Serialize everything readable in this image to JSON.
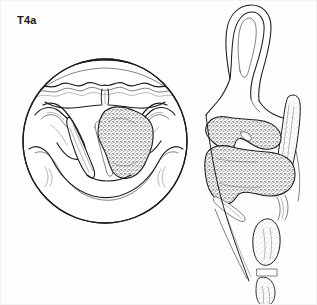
{
  "figure": {
    "stage_label": "T4a",
    "view_left_name": "laryngoscopic-view",
    "view_right_name": "sagittal-section-view",
    "background_color": "#fefefe",
    "ink_color": "#1d1d1d",
    "tumor_fill_color": "#6e6e6e"
  },
  "laryngoscopic_view": {
    "outline_shape": "circle",
    "structures": [
      {
        "key": "epiglottis",
        "label": "epiglottis"
      },
      {
        "key": "median-glossoepiglottic-fold",
        "label": "median glossoepiglottic fold"
      },
      {
        "key": "vallecula",
        "label": "vallecula"
      },
      {
        "key": "aryepiglottic-fold-left",
        "label": "left aryepiglottic fold"
      },
      {
        "key": "aryepiglottic-fold-right",
        "label": "right aryepiglottic fold"
      },
      {
        "key": "true-vocal-cord-left",
        "label": "left true vocal cord"
      },
      {
        "key": "true-vocal-cord-right",
        "label": "right true vocal cord"
      },
      {
        "key": "arytenoid-left",
        "label": "left arytenoid"
      },
      {
        "key": "arytenoid-right",
        "label": "right arytenoid"
      },
      {
        "key": "posterior-commissure",
        "label": "posterior commissure"
      },
      {
        "key": "pyriform-sinus",
        "label": "pyriform sinus"
      },
      {
        "key": "tumor-mass",
        "label": "tumour mass"
      }
    ]
  },
  "sagittal_view": {
    "structures": [
      {
        "key": "epiglottis-cartilage",
        "label": "epiglottic cartilage"
      },
      {
        "key": "pre-epiglottic-space",
        "label": "pre-epiglottic space"
      },
      {
        "key": "thyroid-cartilage",
        "label": "thyroid cartilage"
      },
      {
        "key": "cricoid-cartilage",
        "label": "cricoid cartilage"
      },
      {
        "key": "tracheal-ring",
        "label": "tracheal ring"
      },
      {
        "key": "vocal-cord",
        "label": "vocal cord"
      },
      {
        "key": "tumor-mass-upper",
        "label": "upper tumour extension"
      },
      {
        "key": "tumor-mass-lower",
        "label": "lower tumour extension"
      }
    ]
  }
}
